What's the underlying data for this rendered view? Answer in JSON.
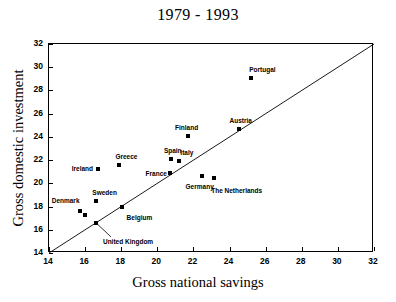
{
  "chart_data": {
    "type": "scatter",
    "title": "1979 - 1993",
    "xlabel": "Gross national savings",
    "ylabel": "Gross domestic investment",
    "xlim": [
      14,
      32
    ],
    "ylim": [
      14,
      32
    ],
    "xticks": [
      14,
      16,
      18,
      20,
      22,
      24,
      26,
      28,
      30,
      32
    ],
    "yticks": [
      14,
      16,
      18,
      20,
      22,
      24,
      26,
      28,
      30,
      32
    ],
    "grid": false,
    "legend": null,
    "reference_line": {
      "name": "45-degree-line",
      "from": [
        14,
        14
      ],
      "to": [
        32,
        32
      ],
      "description": "y = x diagonal line"
    },
    "marker_style": "filled-square",
    "marker_color": "#000000",
    "points": [
      {
        "label": "Denmark",
        "x": 15.7,
        "y": 17.6,
        "label_dx": -28,
        "label_dy": -13,
        "leader": false
      },
      {
        "label": "",
        "x": 16.0,
        "y": 17.3,
        "label_dx": 0,
        "label_dy": 0,
        "leader": false
      },
      {
        "label": "United Kingdom",
        "x": 16.6,
        "y": 16.6,
        "label_dx": 7,
        "label_dy": 16,
        "leader": true
      },
      {
        "label": "Sweden",
        "x": 16.62,
        "y": 18.5,
        "label_dx": -4,
        "label_dy": -11,
        "leader": false
      },
      {
        "label": "Ireland",
        "x": 16.7,
        "y": 21.2,
        "label_dx": -26,
        "label_dy": -3,
        "leader": false
      },
      {
        "label": "Greece",
        "x": 17.9,
        "y": 21.62,
        "label_dx": -4,
        "label_dy": -11,
        "leader": false
      },
      {
        "label": "Belgium",
        "x": 18.02,
        "y": 17.98,
        "label_dx": 5,
        "label_dy": 8,
        "leader": false
      },
      {
        "label": "France",
        "x": 20.68,
        "y": 20.85,
        "label_dx": -24,
        "label_dy": -2,
        "leader": false
      },
      {
        "label": "Spain",
        "x": 20.75,
        "y": 22.1,
        "label_dx": -7,
        "label_dy": -11,
        "leader": false
      },
      {
        "label": "Italy",
        "x": 21.22,
        "y": 21.9,
        "label_dx": 1,
        "label_dy": -11,
        "leader": false
      },
      {
        "label": "Finland",
        "x": 21.7,
        "y": 24.08,
        "label_dx": -13,
        "label_dy": -11,
        "leader": false
      },
      {
        "label": "Germany",
        "x": 22.45,
        "y": 20.65,
        "label_dx": -16,
        "label_dy": 8,
        "leader": false
      },
      {
        "label": "The Netherlands",
        "x": 23.15,
        "y": 20.5,
        "label_dx": -3,
        "label_dy": 10,
        "leader": false
      },
      {
        "label": "Austria",
        "x": 24.5,
        "y": 24.7,
        "label_dx": -9,
        "label_dy": -11,
        "leader": false
      },
      {
        "label": "Portugal",
        "x": 25.2,
        "y": 29.1,
        "label_dx": -2,
        "label_dy": -11,
        "leader": false
      }
    ]
  }
}
